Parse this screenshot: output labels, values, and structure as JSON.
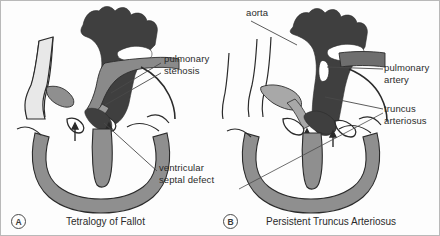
{
  "figure": {
    "background_color": "#fdfdfd",
    "border_color": "#b9b9b9"
  },
  "colors": {
    "dark_chamber": "#3f3f3f",
    "mid_vessel": "#8a8a8a",
    "light_vessel": "#a8a8a8",
    "outline": "#2b2b2b",
    "leader_line": "#4a4a4a",
    "text": "#2b2b2b"
  },
  "panels": [
    {
      "id": "A",
      "marker": "A",
      "caption": "Tetralogy of Fallot",
      "labels": [
        {
          "name": "pulmonary-stenosis",
          "line1": "pulmonary",
          "line2": "stenosis",
          "x": 163,
          "y": 54
        },
        {
          "name": "ventricular-septal-defect",
          "line1": "ventricular",
          "line2": "septal defect",
          "x": 159,
          "y": 163
        }
      ]
    },
    {
      "id": "B",
      "marker": "B",
      "caption": "Persistent Truncus Arteriosus",
      "labels": [
        {
          "name": "aorta",
          "line1": "aorta",
          "line2": "",
          "x": 245,
          "y": 8
        },
        {
          "name": "pulmonary-artery",
          "line1": "pulmonary",
          "line2": "artery",
          "x": 383,
          "y": 63
        },
        {
          "name": "truncus-arteriosus",
          "line1": "truncus",
          "line2": "arteriosus",
          "x": 383,
          "y": 104
        }
      ]
    }
  ]
}
